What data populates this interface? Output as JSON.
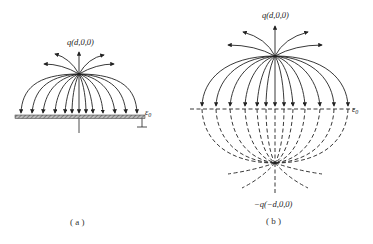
{
  "panel_a": {
    "charge_label": "q(d,0,0)",
    "permittivity_label": "ε0",
    "caption": "( a )",
    "description": "Point charge above grounded conducting plane; field lines terminate on the plane"
  },
  "panel_b": {
    "charge_label": "q(d,0,0)",
    "image_charge_label": "−q(−d,0,0)",
    "permittivity_label": "ε0",
    "caption": "( b )",
    "description": "Method of images: real charge and image charge; dashed lines are virtual field lines below plane"
  },
  "colors": {
    "line": "#222222",
    "plate_fill": "#999999",
    "background": "#ffffff"
  }
}
